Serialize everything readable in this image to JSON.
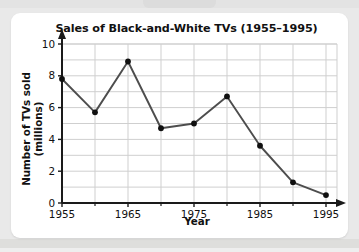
{
  "chart_data": {
    "type": "line",
    "title": "Sales of Black-and-White TVs (1955–1995)",
    "xlabel": "Year",
    "ylabel": "Number of TVs sold (millions)",
    "x": [
      1955,
      1960,
      1965,
      1970,
      1975,
      1980,
      1985,
      1990,
      1995
    ],
    "values": [
      7.8,
      5.7,
      8.9,
      4.7,
      5.0,
      6.7,
      3.6,
      1.3,
      0.5
    ],
    "series": [
      {
        "name": "Black-and-white TV sales",
        "values": [
          7.8,
          5.7,
          8.9,
          4.7,
          5.0,
          6.7,
          3.6,
          1.3,
          0.5
        ]
      }
    ],
    "xlim": [
      1955,
      1997.5
    ],
    "ylim": [
      0,
      10
    ],
    "x_tick_labels": [
      "1955",
      "1965",
      "1975",
      "1985",
      "1995"
    ],
    "x_tick_values": [
      1955,
      1965,
      1975,
      1985,
      1995
    ],
    "x_minor_ticks": [
      1960,
      1970,
      1980,
      1990
    ],
    "y_tick_labels": [
      "0",
      "2",
      "4",
      "6",
      "8",
      "10"
    ],
    "y_tick_values": [
      0,
      2,
      4,
      6,
      8,
      10
    ],
    "y_gridlines": [
      1,
      2,
      3,
      4,
      5,
      6,
      7,
      8,
      9,
      10
    ],
    "grid": true,
    "legend": false,
    "marker": "filled-circle",
    "line_color": "#4d4d4d",
    "marker_color": "#101010",
    "grid_color": "#cfcfcf",
    "axis_color": "#1a1a1a",
    "background": "#ffffff",
    "page_background": "#e9e9e9"
  }
}
